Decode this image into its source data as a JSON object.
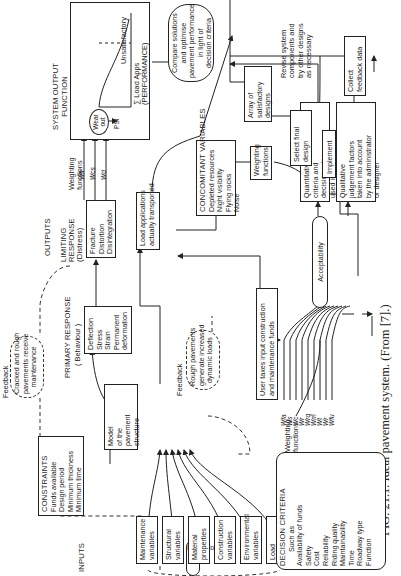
{
  "caption": "FIG. 21.1. Ideal pavement system. (From [7].)",
  "sections": {
    "inputs": "INPUTS",
    "outputs": "OUTPUTS"
  },
  "interactions": "Interactions",
  "input_variables": [
    {
      "line1": "Maintenance",
      "line2": "variables"
    },
    {
      "line1": "Structural",
      "line2": "variables"
    },
    {
      "line1": "Material",
      "line2": "properties"
    },
    {
      "line1": "Construction",
      "line2": "variables"
    },
    {
      "line1": "Environmental",
      "line2": "variables"
    },
    {
      "line1": "Load",
      "line2": "variables"
    }
  ],
  "constraints": {
    "title": "CONSTRAINTS",
    "items": [
      "Funds available",
      "Design period",
      "Minimum thickness",
      "Minimum time"
    ]
  },
  "model": {
    "lines": [
      "Model",
      "of the",
      "pavement",
      "structure"
    ]
  },
  "primary_response": {
    "title": "PRIMARY RESPONSE",
    "subtitle": "( Behaviour )",
    "items": [
      "Deflection",
      "Stress",
      "Strain",
      "Permanent",
      "deformation"
    ]
  },
  "limiting_response": {
    "title1": "LIMITING",
    "title2": "RESPONSE",
    "subtitle": "(Distress)",
    "items": [
      "Fracture",
      "Distortion",
      "Disintegration"
    ]
  },
  "feedback_top": {
    "label": "Feedback",
    "lines": [
      "Cracked and rough",
      "pavements receive",
      "maintenance"
    ]
  },
  "feedback_bottom": {
    "label": "Feedback",
    "lines": [
      "Rough pavements",
      "generate increased",
      "dynamic loads"
    ]
  },
  "distress_weighting": {
    "label1": "Weighting",
    "label2": "functions",
    "symbols": [
      "Wfr",
      "Wcs",
      "Wd"
    ]
  },
  "system_output": {
    "title1": "SYSTEM OUTPUT",
    "title2": "FUNCTION",
    "wear_out": "Wear out",
    "psi": "PSI",
    "axis_label": "∑ Load Apps",
    "axis_sub": "(PERFORMANCE)"
  },
  "load_applications": {
    "lines": [
      "Load applications",
      "actually transported"
    ]
  },
  "concomitant": {
    "title": "CONCOMITANT VARIABLES",
    "items": [
      "Depleted resources",
      "Night visibility",
      "Flying rocks",
      "Noise"
    ]
  },
  "concomitant_weighting": {
    "lines": [
      "Weighting",
      "functions"
    ]
  },
  "user_taxes": {
    "lines": [
      "User taxes input construction",
      "and maintenance funds"
    ]
  },
  "decision_criteria": {
    "title": "DECISION CRITERIA",
    "subtitle": "Such as",
    "items": [
      "Availability of funds",
      "Safety",
      "Cost",
      "Reliability",
      "Riding quality",
      "Maintainability",
      "Time",
      "Roadway type",
      "Function"
    ]
  },
  "decision_weighting": {
    "label1": "Weighting",
    "label2": "functions",
    "symbols": [
      "Wfa",
      "Ws",
      "Wc",
      "Wr",
      "Wrq",
      "Wm",
      "Wt",
      "Wr",
      "Wfu"
    ]
  },
  "acceptability": "Acceptability",
  "quantitative": {
    "lines": [
      "Quantitative",
      "criteria and",
      "decision rules",
      "used in computer"
    ]
  },
  "qualitative": {
    "lines": [
      "Qualitative",
      "judgement factors",
      "taken into account",
      "by the administrator",
      "or designer"
    ]
  },
  "compare": {
    "lines": [
      "Compare solutions",
      "and optimise",
      "pavement performance",
      "in light of",
      "decision criteria"
    ]
  },
  "unsatisfactory": "Unsatisfactory",
  "revise": {
    "lines": [
      "Revise system",
      "components and",
      "try other designs",
      "as necessary"
    ]
  },
  "array": {
    "lines": [
      "Array of",
      "satisfactory",
      "designs"
    ]
  },
  "select": {
    "lines": [
      "Select final",
      "design"
    ]
  },
  "implement": "Implement",
  "collect": {
    "lines": [
      "Collect",
      "feedback data"
    ]
  }
}
